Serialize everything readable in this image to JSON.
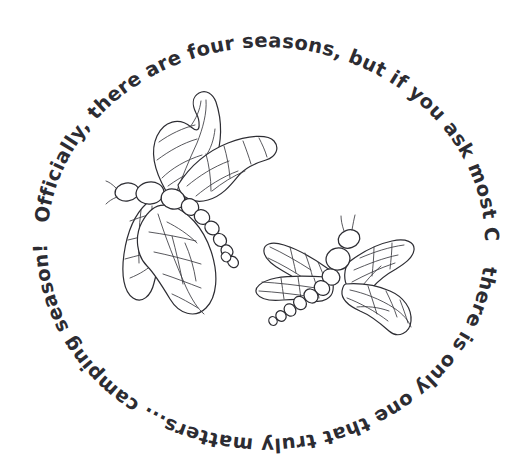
{
  "artwork": {
    "title": "Dragonfly Camping Season Line Art",
    "background_color": "#ffffff",
    "ink_color": "#2d2d33",
    "style": "hand-drawn black line art, coloring-book style"
  },
  "quote": {
    "full_text": "Officially, there are four seasons, but if you ask most Canadians there is only one that truly matters... camping season!",
    "arc_segment_top": "Officially, there are four seasons, but if you ask most Canadians",
    "arc_segment_bottom": "there is only one that truly matters... camping season!",
    "layout": "text set on a full circular path running clockwise from upper-left"
  },
  "subjects": [
    {
      "name": "dragonfly-upper-left",
      "label": "Dragonfly",
      "orientation": "facing left, wings swept up-right and down",
      "wings": 4,
      "tail_segments": 8
    },
    {
      "name": "dragonfly-lower-right",
      "label": "Dragonfly",
      "orientation": "facing up-right, wings spread horizontally",
      "wings": 4,
      "tail_segments": 7
    }
  ]
}
